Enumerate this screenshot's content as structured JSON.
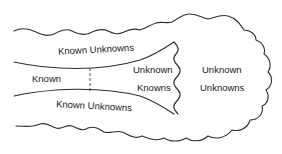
{
  "diagram": {
    "type": "knowledge-quadrant-cloud",
    "regions": {
      "known": {
        "label": "Known"
      },
      "known_unknowns_top": {
        "label": "Known Unknowns"
      },
      "known_unknowns_bottom": {
        "label": "Known Unknowns"
      },
      "unknown_knowns": {
        "line1": "Unknown",
        "line2": "Knowns"
      },
      "unknown_unknowns": {
        "line1": "Unknown",
        "line2": "Unknowns"
      }
    },
    "colors": {
      "stroke": "#2e2e2e",
      "text": "#222222",
      "background": "#ffffff"
    }
  }
}
